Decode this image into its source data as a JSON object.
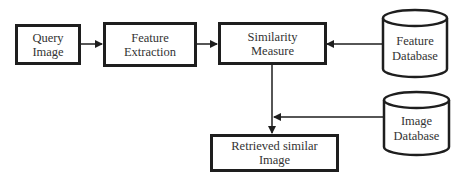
{
  "diagram": {
    "nodes": {
      "query_image": {
        "label": "Query\nImage",
        "shape": "rectangle"
      },
      "feature_extraction": {
        "label": "Feature\nExtraction",
        "shape": "rectangle"
      },
      "similarity_measure": {
        "label": "Similarity\nMeasure",
        "shape": "rectangle"
      },
      "feature_database": {
        "label": "Feature\nDatabase",
        "shape": "cylinder"
      },
      "image_database": {
        "label": "Image\nDatabase",
        "shape": "cylinder"
      },
      "retrieved_image": {
        "label": "Retrieved similar\nImage",
        "shape": "rectangle"
      }
    },
    "edges": [
      {
        "from": "Query Image",
        "to": "Feature Extraction"
      },
      {
        "from": "Feature Extraction",
        "to": "Similarity Measure"
      },
      {
        "from": "Feature Database",
        "to": "Similarity Measure"
      },
      {
        "from": "Similarity Measure",
        "to": "Retrieved similar Image"
      },
      {
        "from": "Image Database",
        "to": "Retrieved similar Image (via connector)"
      }
    ],
    "colors": {
      "stroke": "#1e1e1e",
      "background": "#ffffff",
      "text": "#333333"
    }
  }
}
